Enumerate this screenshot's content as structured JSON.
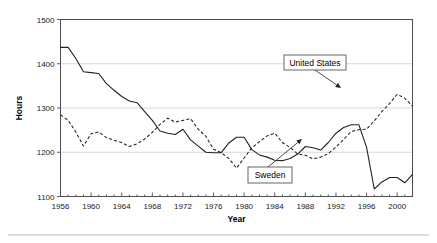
{
  "figure": {
    "width": 437,
    "height": 243,
    "background": "#ffffff",
    "footer_rule_color": "#b8b8b8"
  },
  "chart_data": {
    "type": "line",
    "title": "",
    "xlabel": "Year",
    "ylabel": "Hours",
    "xlim": [
      1956,
      2002
    ],
    "ylim": [
      1100,
      1500
    ],
    "yticks": [
      1100,
      1200,
      1300,
      1400,
      1500
    ],
    "ytick_labels": [
      "1100",
      "1200",
      "1300",
      "1400",
      "1500"
    ],
    "xticks": [
      1956,
      1960,
      1964,
      1968,
      1972,
      1976,
      1980,
      1984,
      1988,
      1992,
      1996,
      2000
    ],
    "xtick_labels": [
      "1956",
      "1960",
      "1964",
      "1968",
      "1972",
      "1976",
      "1980",
      "1984",
      "1988",
      "1992",
      "1996",
      "2000"
    ],
    "x_minor_step": 1,
    "grid": "horizontal-major",
    "legend_position": "inline-callouts",
    "line_color": "#222222",
    "grid_color": "#d4d4d4",
    "axis_color": "#4d4d4d",
    "x": [
      1956,
      1957,
      1958,
      1959,
      1960,
      1961,
      1962,
      1963,
      1964,
      1965,
      1966,
      1967,
      1968,
      1969,
      1970,
      1971,
      1972,
      1973,
      1974,
      1975,
      1976,
      1977,
      1978,
      1979,
      1980,
      1981,
      1982,
      1983,
      1984,
      1985,
      1986,
      1987,
      1988,
      1989,
      1990,
      1991,
      1992,
      1993,
      1994,
      1995,
      1996,
      1997,
      1998,
      1999,
      2000,
      2001,
      2002
    ],
    "series": [
      {
        "name": "Sweden",
        "style": "solid",
        "values": [
          1437,
          1437,
          1412,
          1382,
          1380,
          1378,
          1355,
          1340,
          1326,
          1316,
          1312,
          1292,
          1272,
          1248,
          1243,
          1240,
          1252,
          1228,
          1214,
          1200,
          1199,
          1199,
          1221,
          1234,
          1234,
          1206,
          1194,
          1189,
          1182,
          1181,
          1186,
          1196,
          1213,
          1210,
          1205,
          1222,
          1243,
          1256,
          1262,
          1262,
          1211,
          1117,
          1133,
          1143,
          1143,
          1131,
          1150
        ]
      },
      {
        "name": "United States",
        "style": "dashed",
        "values": [
          1285,
          1272,
          1246,
          1214,
          1242,
          1246,
          1233,
          1227,
          1222,
          1213,
          1219,
          1230,
          1245,
          1263,
          1277,
          1268,
          1272,
          1276,
          1252,
          1236,
          1207,
          1199,
          1186,
          1164,
          1187,
          1210,
          1224,
          1237,
          1243,
          1222,
          1211,
          1196,
          1193,
          1185,
          1189,
          1197,
          1212,
          1229,
          1247,
          1251,
          1252,
          1271,
          1292,
          1310,
          1331,
          1322,
          1304
        ]
      }
    ],
    "series_extra": {
      "sweden_tail_x": [
        1993,
        1994,
        1995,
        1996,
        1997,
        1998,
        1999,
        2000,
        2001,
        2002
      ],
      "us_tail_x": [
        1993,
        1994,
        1995,
        1996,
        1997,
        1998,
        1999,
        2000,
        2001,
        2002
      ]
    },
    "annotations": [
      {
        "label": "United States",
        "box": {
          "x": 284,
          "y": 55,
          "width": 62,
          "height": 15
        },
        "leader_from": {
          "x": 315,
          "y": 70
        },
        "leader_to": {
          "x": 341,
          "y": 88
        },
        "target_point": {
          "year": 1994,
          "value": 1351
        }
      },
      {
        "label": "Sweden",
        "box": {
          "x": 248,
          "y": 167,
          "width": 44,
          "height": 16
        },
        "leader_from": {
          "x": 268,
          "y": 167
        },
        "leader_to": {
          "x": 302,
          "y": 139
        },
        "target_point": {
          "year": 1991,
          "value": 1232
        }
      }
    ]
  },
  "axes": {
    "y_title": "Hours",
    "x_title": "Year"
  }
}
